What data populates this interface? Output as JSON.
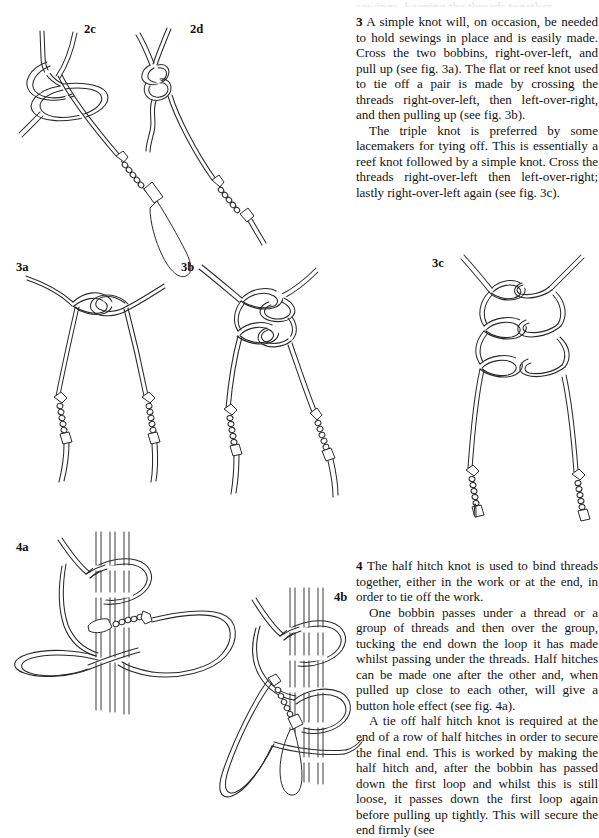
{
  "page": {
    "width": 599,
    "height": 816,
    "background": "#ffffff",
    "ink_color": "#2a2a2a",
    "text_color": "#141414",
    "ghost_top_line": "sewings, keeping the threads together"
  },
  "text": {
    "para3": {
      "number": "3",
      "body": "A simple knot will, on occasion, be needed to hold sewings in place and is easily made. Cross the two bobbins, right-over-left, and pull up (see fig. 3a). The flat or reef knot used to tie off a pair is made by crossing the threads right-over-left, then left-over-right, and then pulling up (see fig. 3b)."
    },
    "para3b": {
      "body": "The triple knot is preferred by some lacemakers for tying off. This is essentially a reef knot followed by a simple knot. Cross the threads right-over-left then left-over-right; lastly right-over-left again (see fig. 3c)."
    },
    "para4": {
      "number": "4",
      "body": "The half hitch knot is used to bind threads together, either in the work or at the end, in order to tie off the work."
    },
    "para4b": {
      "body": "One bobbin passes under a thread or a group of threads and then over the group, tucking the end down the loop it has made whilst passing under the threads. Half hitches can be made one after the other and, when pulled up close to each other, will give a button hole effect (see fig. 4a)."
    },
    "para4c": {
      "body": "A tie off half hitch knot is required at the end of a row of half hitches in order to secure the final end. This is worked by making the half hitch and, after the bobbin has passed down the first loop and whilst this is still loose, it passes down the first loop again before pulling up tightly. This will secure the end firmly (see"
    }
  },
  "figures": [
    {
      "id": "2c",
      "label": "2c",
      "x": 84,
      "y": 22,
      "caption": "simple knot with single bobbin, loop open"
    },
    {
      "id": "2d",
      "label": "2d",
      "x": 190,
      "y": 22,
      "caption": "simple knot pulled up with bobbin"
    },
    {
      "id": "3a",
      "label": "3a",
      "x": 16,
      "y": 260,
      "caption": "simple knot crossing two bobbin threads"
    },
    {
      "id": "3b",
      "label": "3b",
      "x": 181,
      "y": 260,
      "caption": "flat or reef knot tying off a pair"
    },
    {
      "id": "3c",
      "label": "3c",
      "x": 432,
      "y": 256,
      "caption": "triple knot: reef knot followed by simple knot"
    },
    {
      "id": "4a",
      "label": "4a",
      "x": 16,
      "y": 540,
      "caption": "half hitch knot around a group of threads"
    },
    {
      "id": "4b",
      "label": "4b",
      "x": 334,
      "y": 590,
      "caption": "tie off half hitch knot passing down first loop twice"
    }
  ]
}
